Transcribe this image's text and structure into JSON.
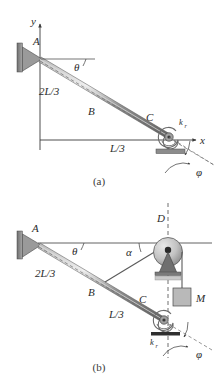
{
  "figure": {
    "background_color": "#ffffff",
    "line_color": "#3a3a3a",
    "beam_fill": "#8a8a8a",
    "support_fill": "#777777",
    "mass_fill": "#b5b5b5",
    "pulley_fill": "#bdbdbd",
    "dash_color": "#6a6a6a"
  },
  "panel_a": {
    "caption": "(a)",
    "axis_y_label": "y",
    "axis_x_label": "x",
    "labels": {
      "point_a": "A",
      "point_b": "B",
      "point_c": "C",
      "theta": "θ",
      "phi": "φ",
      "length_upper": "2L/3",
      "length_lower": "L/3",
      "spring": "k",
      "spring_sub": "r"
    }
  },
  "panel_b": {
    "caption": "(b)",
    "labels": {
      "point_a": "A",
      "point_b": "B",
      "point_c": "C",
      "point_d": "D",
      "theta": "θ",
      "alpha": "α",
      "phi": "φ",
      "mass": "M",
      "length_upper": "2L/3",
      "length_lower": "L/3",
      "spring": "k",
      "spring_sub": "r"
    }
  }
}
